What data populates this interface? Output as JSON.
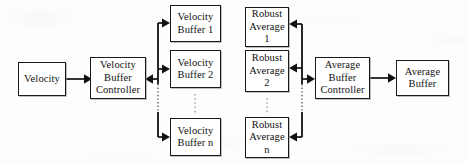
{
  "diagram": {
    "type": "block-diagram",
    "nodes": {
      "velocity": {
        "label": "Velocity",
        "x": 18,
        "y": 62,
        "w": 48,
        "h": 34
      },
      "velocity_buffer_controller": {
        "label": "Velocity\nBuffer\nController",
        "x": 90,
        "y": 57,
        "w": 56,
        "h": 42
      },
      "velocity_buffer_1": {
        "label": "Velocity\nBuffer 1",
        "x": 170,
        "y": 5,
        "w": 51,
        "h": 37
      },
      "velocity_buffer_2": {
        "label": "Velocity\nBuffer 2",
        "x": 170,
        "y": 50,
        "w": 51,
        "h": 38
      },
      "velocity_buffer_n": {
        "label": "Velocity\nBuffer n",
        "x": 170,
        "y": 118,
        "w": 51,
        "h": 38
      },
      "robust_average_1": {
        "label": "Robust\nAverage\n1",
        "x": 245,
        "y": 7,
        "w": 44,
        "h": 40
      },
      "robust_average_2": {
        "label": "Robust\nAverage\n2",
        "x": 245,
        "y": 50,
        "w": 44,
        "h": 42
      },
      "robust_average_n": {
        "label": "Robust\nAverage\nn",
        "x": 245,
        "y": 117,
        "w": 44,
        "h": 41
      },
      "average_buffer_controller": {
        "label": "Average\nBuffer\nController",
        "x": 315,
        "y": 57,
        "w": 55,
        "h": 42
      },
      "average_buffer": {
        "label": "Average\nBuffer",
        "x": 396,
        "y": 60,
        "w": 53,
        "h": 36
      }
    },
    "node_labels": {
      "velocity": [
        "Velocity"
      ],
      "velocity_buffer_controller": [
        "Velocity",
        "Buffer",
        "Controller"
      ],
      "velocity_buffer_1": [
        "Velocity",
        "Buffer 1"
      ],
      "velocity_buffer_2": [
        "Velocity",
        "Buffer 2"
      ],
      "velocity_buffer_n": [
        "Velocity",
        "Buffer n"
      ],
      "robust_average_1": [
        "Robust",
        "Average",
        "1"
      ],
      "robust_average_2": [
        "Robust",
        "Average",
        "2"
      ],
      "robust_average_n": [
        "Robust",
        "Average",
        "n"
      ],
      "average_buffer_controller": [
        "Average",
        "Buffer",
        "Controller"
      ],
      "average_buffer": [
        "Average",
        "Buffer"
      ]
    },
    "edges": [
      {
        "name": "velocity-to-velocity-buffer-controller",
        "from": "velocity",
        "to": "velocity_buffer_controller",
        "direction": "right"
      },
      {
        "name": "velocity-bus-to-buffer-1",
        "from": "velocity_bus",
        "to": "velocity_buffer_1",
        "direction": "right"
      },
      {
        "name": "velocity-bus-to-buffer-2",
        "from": "velocity_bus",
        "to": "velocity_buffer_2",
        "direction": "right"
      },
      {
        "name": "velocity-bus-to-buffer-n",
        "from": "velocity_bus",
        "to": "velocity_buffer_n",
        "direction": "right"
      },
      {
        "name": "velocity-bus-to-controller",
        "from": "velocity_bus",
        "to": "velocity_buffer_controller",
        "direction": "left"
      },
      {
        "name": "average-bus-to-robust-average-1",
        "from": "average_bus",
        "to": "robust_average_1",
        "direction": "left"
      },
      {
        "name": "average-bus-to-robust-average-2",
        "from": "average_bus",
        "to": "robust_average_2",
        "direction": "left"
      },
      {
        "name": "average-bus-to-robust-average-n",
        "from": "average_bus",
        "to": "robust_average_n",
        "direction": "left"
      },
      {
        "name": "average-bus-to-average-buffer-controller",
        "from": "average_bus",
        "to": "average_buffer_controller",
        "direction": "right"
      },
      {
        "name": "average-buffer-controller-to-average-buffer",
        "from": "average_buffer_controller",
        "to": "average_buffer",
        "direction": "right"
      }
    ],
    "ellipses": [
      {
        "name": "velocity-buffer-ellipsis",
        "between": [
          "velocity_buffer_2",
          "velocity_buffer_n"
        ]
      },
      {
        "name": "robust-average-ellipsis",
        "between": [
          "robust_average_2",
          "robust_average_n"
        ]
      }
    ],
    "colors": {
      "stroke": "#111111",
      "box_fill": "#ffffff",
      "background": "#fdfdfd",
      "ellipsis": "#8a8a8a"
    }
  }
}
